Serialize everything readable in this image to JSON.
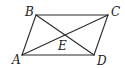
{
  "figure": {
    "shape": "parallelogram",
    "vertices": {
      "A": {
        "label": "A",
        "x": 22,
        "y": 55,
        "lx": 12,
        "ly": 64
      },
      "B": {
        "label": "B",
        "x": 36,
        "y": 15,
        "lx": 25,
        "ly": 16
      },
      "C": {
        "label": "C",
        "x": 108,
        "y": 15,
        "lx": 111,
        "ly": 16
      },
      "D": {
        "label": "D",
        "x": 94,
        "y": 55,
        "lx": 97,
        "ly": 65
      },
      "E": {
        "label": "E",
        "x": 65,
        "y": 35,
        "lx": 58,
        "ly": 50
      }
    },
    "segments": [
      "AB",
      "BC",
      "CD",
      "DA",
      "AC",
      "BD"
    ],
    "intersection": "E is the intersection of diagonals AC and BD",
    "stroke_color": "#2a2a2a"
  }
}
